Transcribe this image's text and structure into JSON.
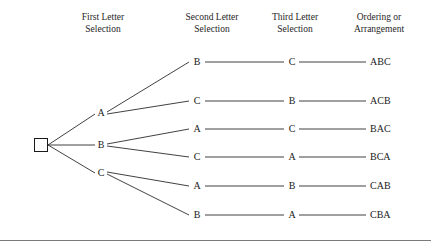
{
  "figure": {
    "title_columns": [
      {
        "line1": "First Letter",
        "line2": "Selection"
      },
      {
        "line1": "Second Letter",
        "line2": "Selection"
      },
      {
        "line1": "Third Letter",
        "line2": "Selection"
      },
      {
        "line1": "Ordering or",
        "line2": "Arrangement"
      }
    ],
    "root_node": {
      "shape": "square",
      "label": ""
    },
    "level1_nodes": [
      {
        "label": "A"
      },
      {
        "label": "B"
      },
      {
        "label": "C"
      }
    ],
    "level2_nodes": [
      {
        "label": "B"
      },
      {
        "label": "C"
      },
      {
        "label": "A"
      },
      {
        "label": "C"
      },
      {
        "label": "A"
      },
      {
        "label": "B"
      }
    ],
    "level3_nodes": [
      {
        "label": "C"
      },
      {
        "label": "B"
      },
      {
        "label": "C"
      },
      {
        "label": "A"
      },
      {
        "label": "B"
      },
      {
        "label": "A"
      }
    ],
    "outcomes": [
      {
        "label": "ABC"
      },
      {
        "label": "ACB"
      },
      {
        "label": "BAC"
      },
      {
        "label": "BCA"
      },
      {
        "label": "CAB"
      },
      {
        "label": "CBA"
      }
    ],
    "colors": {
      "line": "#2b2b2b",
      "text": "#1a1a1a",
      "rule": "#7a7a7a",
      "background": "#ffffff"
    }
  }
}
